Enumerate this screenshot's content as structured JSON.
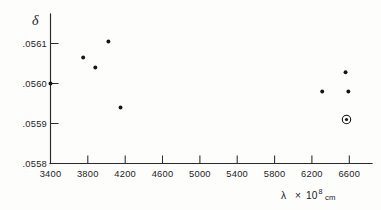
{
  "chart_data": {
    "type": "scatter",
    "title": "",
    "subtitle": "",
    "xlabel": "λ  × 10⁸ cm",
    "xlabel_parts": {
      "symbol": "λ",
      "times": "×",
      "mantissa": "10",
      "exponent": "8",
      "unit": "cm"
    },
    "ylabel": "δ",
    "xlim": [
      3400,
      6800
    ],
    "ylim": [
      0.0558,
      0.05615
    ],
    "xticks": [
      3400,
      3800,
      4200,
      4600,
      5000,
      5400,
      5800,
      6200,
      6600
    ],
    "xtick_labels": [
      "3400",
      "3800",
      "4200",
      "4600",
      "5000",
      "5400",
      "5800",
      "6200",
      "6600"
    ],
    "yticks": [
      0.0558,
      0.0559,
      0.056,
      0.0561
    ],
    "ytick_labels": [
      ".0558",
      ".0559",
      ".0560",
      ".0561"
    ],
    "grid": false,
    "legend": null,
    "legend_position": "none",
    "series": [
      {
        "name": "measured",
        "marker": "filled-circle",
        "color": "#151515",
        "points": [
          {
            "x": 3400,
            "y": 0.056
          },
          {
            "x": 3750,
            "y": 0.056065
          },
          {
            "x": 3880,
            "y": 0.05604
          },
          {
            "x": 4020,
            "y": 0.056105
          },
          {
            "x": 4150,
            "y": 0.05594
          },
          {
            "x": 6310,
            "y": 0.05598
          },
          {
            "x": 6560,
            "y": 0.056028
          },
          {
            "x": 6590,
            "y": 0.05598
          }
        ]
      },
      {
        "name": "highlighted",
        "marker": "circled-dot",
        "color": "#151515",
        "points": [
          {
            "x": 6570,
            "y": 0.05591
          }
        ]
      }
    ]
  },
  "axes": {
    "y_axis_name": "delta-axis",
    "x_axis_name": "lambda-axis"
  }
}
